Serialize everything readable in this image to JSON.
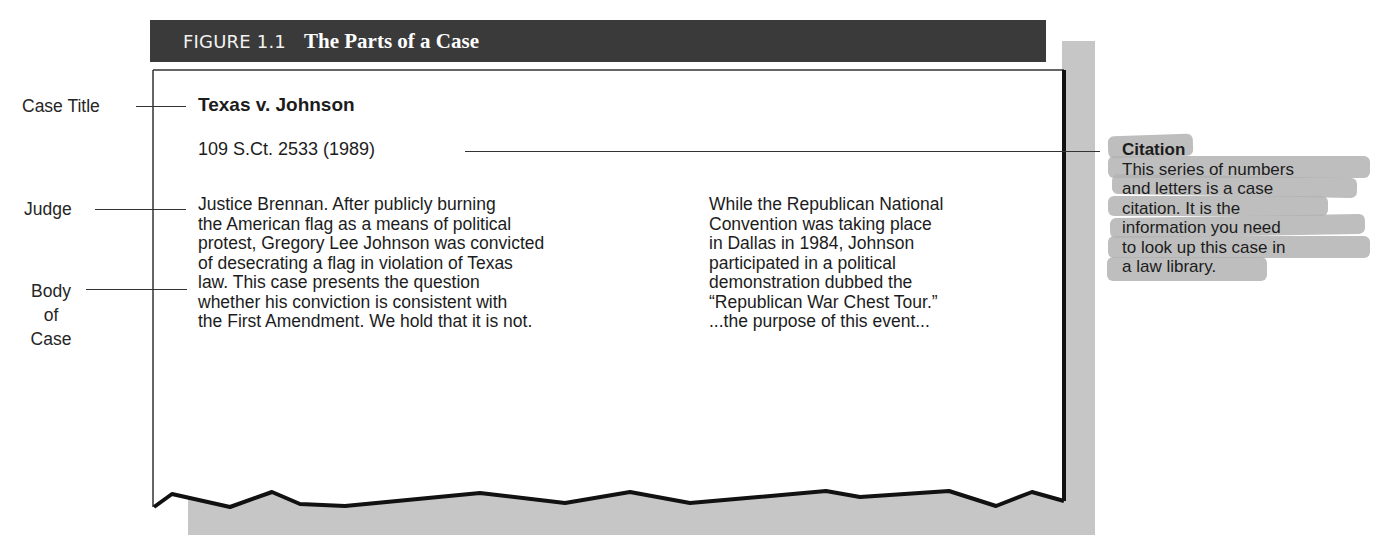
{
  "figure": {
    "label": "FIGURE 1.1",
    "title": "The Parts of a Case"
  },
  "case": {
    "title": "Texas v. Johnson",
    "citation": "109 S.Ct. 2533 (1989)",
    "column_left": [
      "Justice Brennan. After publicly burning",
      "the American flag as a means of political",
      "protest, Gregory Lee Johnson was convicted",
      "of desecrating a flag in violation of Texas",
      "law. This case presents the question",
      "whether his conviction is consistent with",
      "the First Amendment. We hold that it is not."
    ],
    "column_right": [
      "While the Republican National",
      "Convention was taking place",
      "in Dallas in 1984, Johnson",
      "participated in a political",
      "demonstration dubbed the",
      "“Republican War Chest Tour.”",
      "...the purpose of this event..."
    ]
  },
  "labels": {
    "case_title": "Case Title",
    "judge": "Judge",
    "body_line1": "Body",
    "body_line2": "of",
    "body_line3": "Case"
  },
  "callout": {
    "title": "Citation",
    "lines": [
      "This series of numbers",
      "and letters is a case",
      "citation. It is the",
      "information you need",
      "to look up this case in",
      "a law library."
    ]
  },
  "colors": {
    "title_bar": "#3a3a3a",
    "shadow": "#c6c6c6",
    "highlight": "#b3b3b3"
  }
}
